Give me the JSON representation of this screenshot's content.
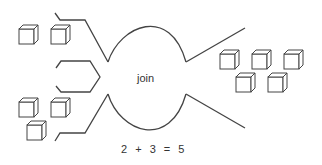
{
  "diagram": {
    "title": "join",
    "equation": "2 + 3 = 5",
    "stroke_color": "#444444",
    "groups": [
      {
        "name": "first-addend",
        "count": 2
      },
      {
        "name": "second-addend",
        "count": 3
      },
      {
        "name": "sum",
        "count": 5
      }
    ],
    "icons": [
      "cube-icon"
    ]
  }
}
